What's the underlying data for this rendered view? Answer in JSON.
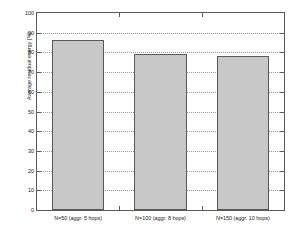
{
  "chart_data": {
    "type": "bar",
    "title": "",
    "xlabel": "",
    "ylabel": "Average residual energy [%]",
    "categories": [
      "N=50 (aggr. 5 hops)",
      "N=100 (aggr. 8 hops)",
      "N=150 (aggr. 10 hops)"
    ],
    "values": [
      86.5,
      79.2,
      78.2
    ],
    "ylim": [
      0,
      100
    ],
    "yticks": [
      0,
      10,
      20,
      30,
      40,
      50,
      60,
      70,
      80,
      90,
      100
    ],
    "ytick_labels": [
      "0",
      "10",
      "20",
      "30",
      "40",
      "50",
      "60",
      "70",
      "80",
      "90",
      "100"
    ],
    "grid": true,
    "grid_axis": "y",
    "grid_style": "dotted",
    "legend": null,
    "bar_fill_color": "#c8c8c8",
    "bar_edge_color": "#585858",
    "axis_color": "#5a5a5a",
    "background_color": "#ffffff"
  }
}
